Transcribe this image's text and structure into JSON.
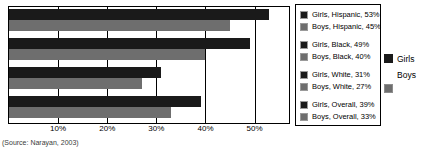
{
  "chart_data": {
    "type": "bar",
    "orientation": "horizontal",
    "title": "",
    "xlabel": "",
    "ylabel": "",
    "xlim": [
      0,
      57
    ],
    "grid": true,
    "gridlines": [
      10,
      20,
      30,
      40,
      50
    ],
    "tick_labels": [
      "10%",
      "20%",
      "30%",
      "40%",
      "50%"
    ],
    "legend_position": "right",
    "categories": [
      "Hispanic",
      "Black",
      "White",
      "Overall"
    ],
    "series": [
      {
        "name": "Girls",
        "color": "#1a1a1a",
        "values": [
          53,
          49,
          31,
          39
        ]
      },
      {
        "name": "Boys",
        "color": "#6e6e6e",
        "values": [
          45,
          40,
          27,
          33
        ]
      }
    ],
    "groups": [
      {
        "category": "Hispanic",
        "bars": [
          {
            "series": "Girls",
            "value": 53,
            "label": "Girls, Hispanic, 53%",
            "color": "#1a1a1a"
          },
          {
            "series": "Boys",
            "value": 45,
            "label": "Boys, Hispanic, 45%",
            "color": "#6e6e6e"
          }
        ]
      },
      {
        "category": "Black",
        "bars": [
          {
            "series": "Girls",
            "value": 49,
            "label": "Girls, Black, 49%",
            "color": "#1a1a1a"
          },
          {
            "series": "Boys",
            "value": 40,
            "label": "Boys, Black, 40%",
            "color": "#6e6e6e"
          }
        ]
      },
      {
        "category": "White",
        "bars": [
          {
            "series": "Girls",
            "value": 31,
            "label": "Girls, White, 31%",
            "color": "#1a1a1a"
          },
          {
            "series": "Boys",
            "value": 27,
            "label": "Boys, White, 27%",
            "color": "#6e6e6e"
          }
        ]
      },
      {
        "category": "Overall",
        "bars": [
          {
            "series": "Girls",
            "value": 39,
            "label": "Girls, Overall, 39%",
            "color": "#1a1a1a"
          },
          {
            "series": "Boys",
            "value": 33,
            "label": "Boys, Overall, 33%",
            "color": "#6e6e6e"
          }
        ]
      }
    ]
  },
  "legend": {
    "entries": [
      "Girls, Hispanic, 53%",
      "Boys, Hispanic, 45%",
      "Girls, Black, 49%",
      "Boys, Black, 40%",
      "Girls, White, 31%",
      "Boys, White, 27%",
      "Girls, Overall, 39%",
      "Boys, Overall, 33%"
    ]
  },
  "series_legend": {
    "girls_label": "Girls",
    "boys_label": "Boys"
  },
  "axis": {
    "tick_labels": [
      "10%",
      "20%",
      "30%",
      "40%",
      "50%"
    ]
  },
  "source": {
    "note": "(Source: Narayan, 2003)"
  },
  "colors": {
    "girls": "#1a1a1a",
    "boys": "#6e6e6e",
    "axis": "#000000",
    "background": "#ffffff"
  }
}
